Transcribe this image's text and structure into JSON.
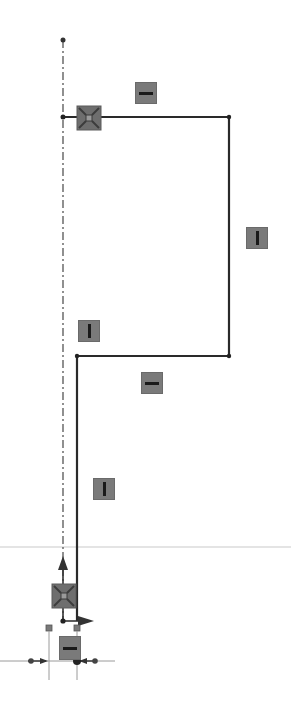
{
  "view": {
    "type": "cad-sketch",
    "background": "#ffffff",
    "line_color": "#2a2a2a",
    "relation_badge_color": "#7a7a7a",
    "relation_glyph_color": "#1a1a1a",
    "reference_line_color": "#9a9a9a"
  },
  "sketch": {
    "centerline": {
      "x": 63,
      "y_top": 40,
      "y_bottom": 621,
      "style": "dash-dot"
    },
    "profile_points": [
      {
        "x": 63,
        "y": 117
      },
      {
        "x": 229,
        "y": 117
      },
      {
        "x": 229,
        "y": 356
      },
      {
        "x": 77,
        "y": 356
      },
      {
        "x": 77,
        "y": 621
      }
    ],
    "segments": [
      {
        "name": "top-horizontal-line",
        "from": [
          63,
          117
        ],
        "to": [
          229,
          117
        ],
        "relation": "horizontal"
      },
      {
        "name": "right-vertical-line",
        "from": [
          229,
          117
        ],
        "to": [
          229,
          356
        ],
        "relation": "vertical"
      },
      {
        "name": "middle-horizontal-line",
        "from": [
          229,
          356
        ],
        "to": [
          77,
          356
        ],
        "relation": "horizontal"
      },
      {
        "name": "left-vertical-line",
        "from": [
          77,
          356
        ],
        "to": [
          77,
          621
        ],
        "relation": "vertical"
      }
    ],
    "relations": [
      {
        "type": "horizontal",
        "icon": "horizontal-relation-icon",
        "x": 135,
        "y": 82
      },
      {
        "type": "coincident",
        "icon": "coincident-relation-icon",
        "x": 77,
        "y": 106
      },
      {
        "type": "vertical",
        "icon": "vertical-relation-icon",
        "x": 246,
        "y": 227
      },
      {
        "type": "vertical",
        "icon": "vertical-relation-icon",
        "x": 78,
        "y": 320
      },
      {
        "type": "horizontal",
        "icon": "horizontal-relation-icon",
        "x": 141,
        "y": 372
      },
      {
        "type": "vertical",
        "icon": "vertical-relation-icon",
        "x": 93,
        "y": 478
      },
      {
        "type": "coincident",
        "icon": "coincident-relation-icon",
        "x": 52,
        "y": 584
      },
      {
        "type": "horizontal",
        "icon": "horizontal-relation-icon",
        "x": 59,
        "y": 636
      }
    ]
  },
  "origin": {
    "x": 63,
    "y": 621,
    "x_arrow_tip": 92,
    "y_arrow_tip": 556
  },
  "reference_lines": {
    "horizontal_y": 661,
    "left_vertical_x": 49,
    "right_vertical_x": 77,
    "faint_horizontal_y": 547
  }
}
